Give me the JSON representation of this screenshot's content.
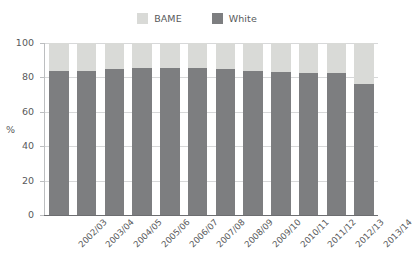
{
  "chart_data": {
    "type": "bar",
    "subtype": "stacked-100-percent",
    "title": "",
    "subtitle": "",
    "xlabel": "",
    "ylabel": "%",
    "ylim": [
      0,
      100
    ],
    "yticks": [
      0,
      20,
      40,
      60,
      80,
      100
    ],
    "grid": true,
    "legend_position": "top-center",
    "categories": [
      "2002/03",
      "2003/04",
      "2004/05",
      "2005/06",
      "2006/07",
      "2007/08",
      "2008/09",
      "2009/10",
      "2010/11",
      "2011/12",
      "2012/13",
      "2013/14"
    ],
    "series": [
      {
        "name": "White",
        "color": "#7d7e80",
        "stack_order": 0,
        "values": [
          84,
          84,
          85,
          85.5,
          85.5,
          85.5,
          85,
          84,
          83,
          82.5,
          82.5,
          76
        ]
      },
      {
        "name": "BAME",
        "color": "#d9dad7",
        "stack_order": 1,
        "values": [
          16,
          16,
          15,
          14.5,
          14.5,
          14.5,
          15,
          16,
          17,
          17.5,
          17.5,
          24
        ]
      }
    ]
  },
  "legend": {
    "entries": [
      {
        "label": "BAME",
        "color": "#d9dad7"
      },
      {
        "label": "White",
        "color": "#7d7e80"
      }
    ]
  },
  "axes": {
    "y_title": "%",
    "y_ticks": [
      "100",
      "80",
      "60",
      "40",
      "20",
      "0"
    ]
  },
  "colors": {
    "bame": "#d9dad7",
    "white": "#7d7e80",
    "text": "#58595b",
    "grid": "#d7d8d9",
    "axis": "#6d6e71",
    "background": "#ffffff"
  }
}
